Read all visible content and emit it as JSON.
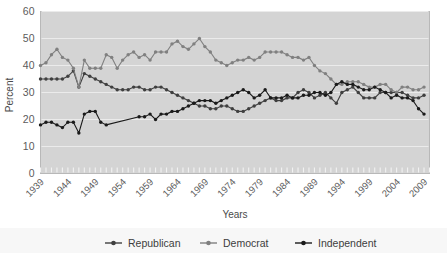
{
  "chart_data": {
    "type": "line",
    "title": "",
    "xlabel": "Years",
    "ylabel": "Percent",
    "ylim": [
      0,
      60
    ],
    "yticks": [
      0,
      10,
      20,
      30,
      40,
      50,
      60
    ],
    "xlim": [
      1939,
      2010
    ],
    "xticks": [
      "1939",
      "1944",
      "1949",
      "1954",
      "1959",
      "1964",
      "1969",
      "1974",
      "1979",
      "1984",
      "1989",
      "1994",
      "1999",
      "2004",
      "2009"
    ],
    "grid": "horizontal",
    "legend_position": "bottom",
    "plot_background": "#d4d4d4",
    "series": [
      {
        "name": "Republican",
        "color": "#3f3f3f",
        "x": [
          1939,
          1940,
          1941,
          1942,
          1943,
          1944,
          1945,
          1946,
          1947,
          1948,
          1949,
          1950,
          1951,
          1952,
          1953,
          1954,
          1955,
          1956,
          1957,
          1958,
          1959,
          1960,
          1961,
          1962,
          1963,
          1964,
          1965,
          1966,
          1967,
          1968,
          1969,
          1970,
          1971,
          1972,
          1973,
          1974,
          1975,
          1976,
          1977,
          1978,
          1979,
          1980,
          1981,
          1982,
          1983,
          1984,
          1985,
          1986,
          1987,
          1988,
          1989,
          1990,
          1991,
          1992,
          1993,
          1994,
          1995,
          1996,
          1997,
          1998,
          1999,
          2000,
          2001,
          2002,
          2003,
          2004,
          2005,
          2006,
          2007,
          2008,
          2009
        ],
        "values": [
          35,
          35,
          35,
          35,
          35,
          36,
          38,
          32,
          37,
          36,
          35,
          34,
          33,
          32,
          31,
          31,
          31,
          32,
          32,
          31,
          31,
          32,
          32,
          31,
          30,
          29,
          28,
          27,
          26,
          25,
          25,
          24,
          24,
          25,
          25,
          24,
          23,
          23,
          24,
          25,
          26,
          27,
          28,
          27,
          27,
          28,
          28,
          30,
          31,
          30,
          28,
          29,
          30,
          28,
          26,
          30,
          31,
          32,
          30,
          28,
          28,
          28,
          30,
          30,
          30,
          30,
          30,
          29,
          28,
          28,
          29
        ]
      },
      {
        "name": "Democrat",
        "color": "#808080",
        "x": [
          1939,
          1940,
          1941,
          1942,
          1943,
          1944,
          1945,
          1946,
          1947,
          1948,
          1949,
          1950,
          1951,
          1952,
          1953,
          1954,
          1955,
          1956,
          1957,
          1958,
          1959,
          1960,
          1961,
          1962,
          1963,
          1964,
          1965,
          1966,
          1967,
          1968,
          1969,
          1970,
          1971,
          1972,
          1973,
          1974,
          1975,
          1976,
          1977,
          1978,
          1979,
          1980,
          1981,
          1982,
          1983,
          1984,
          1985,
          1986,
          1987,
          1988,
          1989,
          1990,
          1991,
          1992,
          1993,
          1994,
          1995,
          1996,
          1997,
          1998,
          1999,
          2000,
          2001,
          2002,
          2003,
          2004,
          2005,
          2006,
          2007,
          2008,
          2009
        ],
        "values": [
          40,
          41,
          44,
          46,
          43,
          42,
          39,
          32,
          42,
          39,
          39,
          39,
          44,
          43,
          39,
          42,
          44,
          45,
          43,
          44,
          42,
          45,
          45,
          45,
          48,
          49,
          47,
          46,
          48,
          50,
          47,
          45,
          42,
          41,
          40,
          41,
          42,
          42,
          43,
          42,
          43,
          45,
          45,
          45,
          45,
          44,
          43,
          43,
          42,
          43,
          40,
          38,
          37,
          35,
          33,
          33,
          34,
          34,
          34,
          33,
          32,
          32,
          33,
          33,
          31,
          30,
          32,
          32,
          31,
          31,
          32
        ]
      },
      {
        "name": "Independent",
        "color": "#1a1a1a",
        "x": [
          1939,
          1940,
          1941,
          1942,
          1943,
          1944,
          1945,
          1946,
          1947,
          1948,
          1949,
          1950,
          1951,
          1957,
          1958,
          1959,
          1960,
          1961,
          1962,
          1963,
          1964,
          1965,
          1966,
          1967,
          1968,
          1969,
          1970,
          1971,
          1972,
          1973,
          1974,
          1975,
          1976,
          1977,
          1978,
          1979,
          1980,
          1981,
          1982,
          1983,
          1984,
          1985,
          1986,
          1987,
          1988,
          1989,
          1990,
          1991,
          1992,
          1993,
          1994,
          1995,
          1996,
          1997,
          1998,
          1999,
          2000,
          2001,
          2002,
          2003,
          2004,
          2005,
          2006,
          2007,
          2008,
          2009
        ],
        "values": [
          18,
          19,
          19,
          18,
          17,
          19,
          19,
          15,
          22,
          23,
          23,
          19,
          18,
          21,
          21,
          22,
          20,
          22,
          22,
          23,
          23,
          24,
          25,
          26,
          27,
          27,
          27,
          26,
          27,
          28,
          29,
          30,
          31,
          30,
          28,
          29,
          31,
          28,
          28,
          28,
          29,
          28,
          28,
          29,
          29,
          30,
          30,
          29,
          30,
          33,
          34,
          33,
          33,
          32,
          31,
          31,
          32,
          31,
          30,
          28,
          29,
          28,
          28,
          27,
          24,
          22
        ]
      }
    ]
  },
  "legend": {
    "items": [
      {
        "label": "Republican",
        "color": "#3f3f3f"
      },
      {
        "label": "Democrat",
        "color": "#808080"
      },
      {
        "label": "Independent",
        "color": "#1a1a1a"
      }
    ]
  }
}
